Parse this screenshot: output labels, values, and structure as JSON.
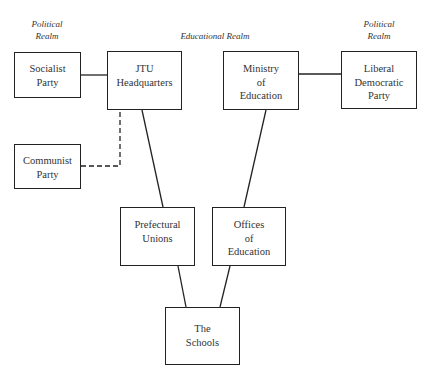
{
  "realms": {
    "political_left": [
      "Political",
      "Realm"
    ],
    "educational": "Educational Realm",
    "political_right": [
      "Political",
      "Realm"
    ]
  },
  "nodes": {
    "socialist": [
      "Socialist",
      "Party"
    ],
    "jtu": [
      "JTU",
      "Headquarters"
    ],
    "ministry": [
      "Ministry",
      "of",
      "Education"
    ],
    "ldp": [
      "Liberal",
      "Democratic",
      "Party"
    ],
    "communist": [
      "Communist",
      "Party"
    ],
    "prefectural": [
      "Prefectural",
      "Unions"
    ],
    "offices": [
      "Offices",
      "of",
      "Education"
    ],
    "schools": [
      "The",
      "Schools"
    ]
  },
  "edges": [
    {
      "from": "socialist",
      "to": "jtu",
      "style": "solid"
    },
    {
      "from": "ministry",
      "to": "ldp",
      "style": "solid"
    },
    {
      "from": "communist",
      "to": "jtu",
      "style": "dashed"
    },
    {
      "from": "jtu",
      "to": "prefectural",
      "style": "solid"
    },
    {
      "from": "ministry",
      "to": "offices",
      "style": "solid"
    },
    {
      "from": "prefectural",
      "to": "schools",
      "style": "solid"
    },
    {
      "from": "offices",
      "to": "schools",
      "style": "solid"
    }
  ]
}
